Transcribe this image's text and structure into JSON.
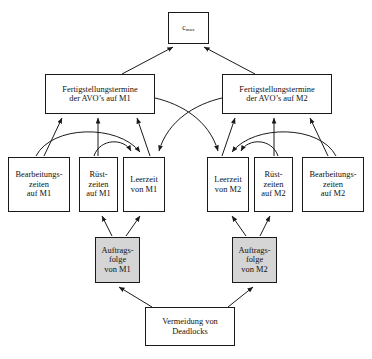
{
  "diagram": {
    "language": "de",
    "style": {
      "line_color": "#1a1a1a",
      "node_fill": "#ffffff",
      "shaded_node_fill": "#d5d5d5",
      "text_color": "#111111",
      "background": "#ffffff"
    },
    "nodes": [
      {
        "id": "cmax",
        "name": "objective-cmax",
        "label_base": "c",
        "label_sub": "max",
        "label_plain": "c max",
        "shaded": false
      },
      {
        "id": "fgt_m1",
        "name": "completion-times-m1",
        "label": "Fertigstellungstermine\nder AVO’s auf M1",
        "shaded": false
      },
      {
        "id": "fgt_m2",
        "name": "completion-times-m2",
        "label": "Fertigstellungstermine\nder AVO’s auf M2",
        "shaded": false
      },
      {
        "id": "bz_m1",
        "name": "processing-times-m1",
        "label": "Bearbeitungs-\nzeiten\nauf M1",
        "shaded": false
      },
      {
        "id": "rz_m1",
        "name": "setup-times-m1",
        "label": "Rüst-\nzeiten\nauf M1",
        "shaded": false
      },
      {
        "id": "lz_m1",
        "name": "idle-time-m1",
        "label": "Leerzeit\nvon M1",
        "shaded": false
      },
      {
        "id": "lz_m2",
        "name": "idle-time-m2",
        "label": "Leerzeit\nvon M2",
        "shaded": false
      },
      {
        "id": "rz_m2",
        "name": "setup-times-m2",
        "label": "Rüst-\nzeiten\nauf M2",
        "shaded": false
      },
      {
        "id": "bz_m2",
        "name": "processing-times-m2",
        "label": "Bearbeitungs-\nzeiten\nauf M2",
        "shaded": false
      },
      {
        "id": "af_m1",
        "name": "job-sequence-m1",
        "label": "Auftrags-\nfolge\nvon M1",
        "shaded": true
      },
      {
        "id": "af_m2",
        "name": "job-sequence-m2",
        "label": "Auftrags-\nfolge\nvon M2",
        "shaded": true
      },
      {
        "id": "vd",
        "name": "deadlock-avoidance",
        "label": "Vermeidung von\nDeadlocks",
        "shaded": false
      }
    ],
    "edges": [
      {
        "from": "fgt_m1",
        "to": "cmax",
        "kind": "straight"
      },
      {
        "from": "fgt_m2",
        "to": "cmax",
        "kind": "straight"
      },
      {
        "from": "bz_m1",
        "to": "fgt_m1",
        "kind": "straight"
      },
      {
        "from": "rz_m1",
        "to": "fgt_m1",
        "kind": "straight"
      },
      {
        "from": "lz_m1",
        "to": "fgt_m1",
        "kind": "straight"
      },
      {
        "from": "bz_m2",
        "to": "fgt_m2",
        "kind": "straight"
      },
      {
        "from": "rz_m2",
        "to": "fgt_m2",
        "kind": "straight"
      },
      {
        "from": "lz_m2",
        "to": "fgt_m2",
        "kind": "straight"
      },
      {
        "from": "bz_m1",
        "to": "lz_m1",
        "kind": "curved"
      },
      {
        "from": "rz_m1",
        "to": "lz_m1",
        "kind": "curved"
      },
      {
        "from": "bz_m2",
        "to": "lz_m2",
        "kind": "curved"
      },
      {
        "from": "rz_m2",
        "to": "lz_m2",
        "kind": "curved"
      },
      {
        "from": "fgt_m2",
        "to": "lz_m1",
        "kind": "curved-cross"
      },
      {
        "from": "fgt_m1",
        "to": "lz_m2",
        "kind": "curved-cross"
      },
      {
        "from": "af_m1",
        "to": "rz_m1",
        "kind": "straight"
      },
      {
        "from": "af_m1",
        "to": "lz_m1",
        "kind": "straight"
      },
      {
        "from": "af_m2",
        "to": "rz_m2",
        "kind": "straight"
      },
      {
        "from": "af_m2",
        "to": "lz_m2",
        "kind": "straight"
      },
      {
        "from": "vd",
        "to": "af_m1",
        "kind": "straight"
      },
      {
        "from": "vd",
        "to": "af_m2",
        "kind": "straight"
      }
    ]
  }
}
